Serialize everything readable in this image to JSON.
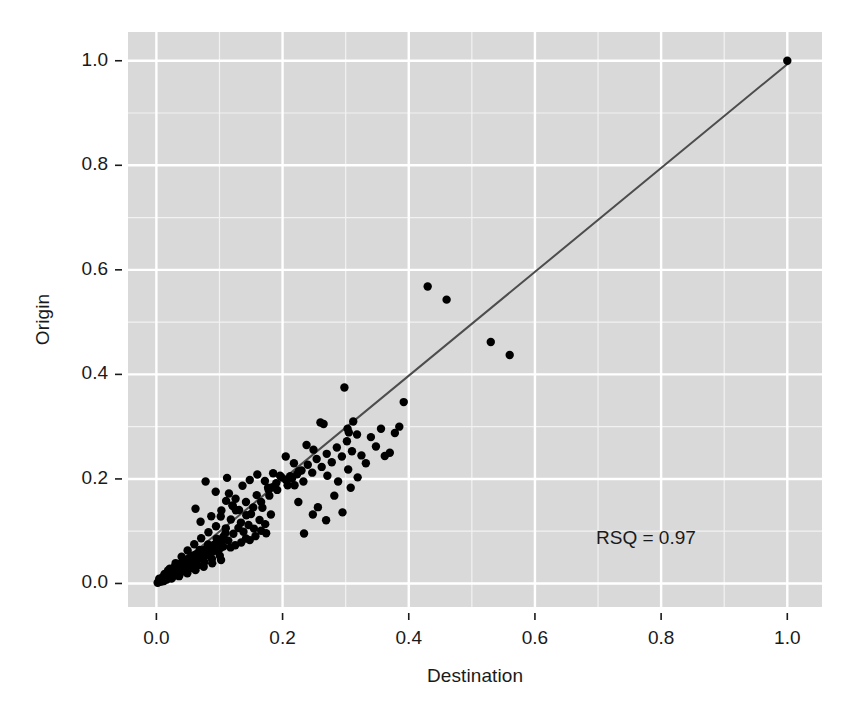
{
  "chart_data": {
    "type": "scatter",
    "title": "",
    "xlabel": "Destination",
    "ylabel": "Origin",
    "xlim": [
      -0.045,
      1.055
    ],
    "ylim": [
      -0.045,
      1.055
    ],
    "x_ticks": [
      0.0,
      0.2,
      0.4,
      0.6,
      0.8,
      1.0
    ],
    "y_ticks": [
      0.0,
      0.2,
      0.4,
      0.6,
      0.8,
      1.0
    ],
    "x_tick_labels": [
      "0.0",
      "0.2",
      "0.4",
      "0.6",
      "0.8",
      "1.0"
    ],
    "y_tick_labels": [
      "0.0",
      "0.2",
      "0.4",
      "0.6",
      "0.8",
      "1.0"
    ],
    "x_minor_ticks": [
      0.1,
      0.3,
      0.5,
      0.7,
      0.9
    ],
    "y_minor_ticks": [
      0.1,
      0.3,
      0.5,
      0.7,
      0.9
    ],
    "grid": true,
    "grid_major_color": "#ffffff",
    "grid_minor_color": "#f2f2f2",
    "panel_background": "#d9d9d9",
    "figure_background": "#ffffff",
    "point_color": "#000000",
    "point_radius": 4.2,
    "legend": null,
    "annotations": [
      {
        "text": "RSQ = 0.97",
        "x": 0.855,
        "y": 0.085
      }
    ],
    "fit_line": {
      "type": "linear",
      "color": "#4d4d4d",
      "width": 2.0,
      "x0": 0.0,
      "y0": 0.0,
      "x1": 1.0,
      "y1": 0.9935
    },
    "series": [
      {
        "name": "points",
        "points": [
          [
            0.002,
            0.0015
          ],
          [
            0.0035,
            0.0028
          ],
          [
            0.0042,
            0.005
          ],
          [
            0.0051,
            0.0036
          ],
          [
            0.006,
            0.0068
          ],
          [
            0.0068,
            0.0045
          ],
          [
            0.0075,
            0.0082
          ],
          [
            0.0083,
            0.0061
          ],
          [
            0.009,
            0.0104
          ],
          [
            0.0098,
            0.0076
          ],
          [
            0.0105,
            0.0122
          ],
          [
            0.0112,
            0.009
          ],
          [
            0.012,
            0.0138
          ],
          [
            0.0128,
            0.01
          ],
          [
            0.0136,
            0.0155
          ],
          [
            0.0144,
            0.0112
          ],
          [
            0.0152,
            0.017
          ],
          [
            0.016,
            0.0126
          ],
          [
            0.017,
            0.0188
          ],
          [
            0.0178,
            0.014
          ],
          [
            0.0186,
            0.0205
          ],
          [
            0.0195,
            0.0152
          ],
          [
            0.0203,
            0.0222
          ],
          [
            0.0212,
            0.0166
          ],
          [
            0.022,
            0.024
          ],
          [
            0.023,
            0.018
          ],
          [
            0.024,
            0.0258
          ],
          [
            0.025,
            0.0196
          ],
          [
            0.026,
            0.0275
          ],
          [
            0.027,
            0.021
          ],
          [
            0.028,
            0.0294
          ],
          [
            0.029,
            0.0225
          ],
          [
            0.03,
            0.0312
          ],
          [
            0.0312,
            0.024
          ],
          [
            0.0324,
            0.033
          ],
          [
            0.0336,
            0.0256
          ],
          [
            0.0348,
            0.035
          ],
          [
            0.036,
            0.0272
          ],
          [
            0.0372,
            0.0368
          ],
          [
            0.0384,
            0.0288
          ],
          [
            0.0396,
            0.0388
          ],
          [
            0.0408,
            0.0305
          ],
          [
            0.042,
            0.0408
          ],
          [
            0.0434,
            0.0322
          ],
          [
            0.0448,
            0.0428
          ],
          [
            0.0462,
            0.034
          ],
          [
            0.0476,
            0.0448
          ],
          [
            0.049,
            0.0358
          ],
          [
            0.0504,
            0.0468
          ],
          [
            0.0518,
            0.0376
          ],
          [
            0.0532,
            0.049
          ],
          [
            0.0546,
            0.0396
          ],
          [
            0.056,
            0.051
          ],
          [
            0.0576,
            0.0415
          ],
          [
            0.0592,
            0.0532
          ],
          [
            0.0608,
            0.0435
          ],
          [
            0.0624,
            0.0554
          ],
          [
            0.064,
            0.0455
          ],
          [
            0.0656,
            0.0576
          ],
          [
            0.0672,
            0.0476
          ],
          [
            0.0688,
            0.0598
          ],
          [
            0.0705,
            0.0496
          ],
          [
            0.0722,
            0.062
          ],
          [
            0.074,
            0.0518
          ],
          [
            0.0758,
            0.0642
          ],
          [
            0.0776,
            0.054
          ],
          [
            0.0794,
            0.0665
          ],
          [
            0.0812,
            0.0562
          ],
          [
            0.083,
            0.0688
          ],
          [
            0.085,
            0.0585
          ],
          [
            0.087,
            0.0712
          ],
          [
            0.089,
            0.0608
          ],
          [
            0.091,
            0.0736
          ],
          [
            0.093,
            0.0632
          ],
          [
            0.095,
            0.076
          ],
          [
            0.0972,
            0.0656
          ],
          [
            0.0994,
            0.0784
          ],
          [
            0.1016,
            0.068
          ],
          [
            0.1038,
            0.081
          ],
          [
            0.106,
            0.0705
          ],
          [
            0.0045,
            0.009
          ],
          [
            0.008,
            0.0035
          ],
          [
            0.013,
            0.018
          ],
          [
            0.0165,
            0.0075
          ],
          [
            0.0215,
            0.0285
          ],
          [
            0.0255,
            0.012
          ],
          [
            0.0305,
            0.039
          ],
          [
            0.0345,
            0.0175
          ],
          [
            0.04,
            0.051
          ],
          [
            0.044,
            0.023
          ],
          [
            0.0495,
            0.063
          ],
          [
            0.054,
            0.029
          ],
          [
            0.06,
            0.075
          ],
          [
            0.065,
            0.035
          ],
          [
            0.071,
            0.0865
          ],
          [
            0.076,
            0.041
          ],
          [
            0.0825,
            0.098
          ],
          [
            0.088,
            0.047
          ],
          [
            0.0945,
            0.1095
          ],
          [
            0.1005,
            0.053
          ],
          [
            0.012,
            0.0045
          ],
          [
            0.0185,
            0.025
          ],
          [
            0.024,
            0.0095
          ],
          [
            0.0295,
            0.033
          ],
          [
            0.036,
            0.014
          ],
          [
            0.0425,
            0.043
          ],
          [
            0.049,
            0.0195
          ],
          [
            0.0555,
            0.053
          ],
          [
            0.062,
            0.0255
          ],
          [
            0.0685,
            0.064
          ],
          [
            0.075,
            0.032
          ],
          [
            0.082,
            0.0745
          ],
          [
            0.0885,
            0.0385
          ],
          [
            0.0955,
            0.0855
          ],
          [
            0.1025,
            0.045
          ],
          [
            0.1095,
            0.0965
          ],
          [
            0.102,
            0.128
          ],
          [
            0.106,
            0.0895
          ],
          [
            0.11,
            0.1055
          ],
          [
            0.114,
            0.082
          ],
          [
            0.118,
            0.1225
          ],
          [
            0.122,
            0.095
          ],
          [
            0.126,
            0.14
          ],
          [
            0.13,
            0.106
          ],
          [
            0.134,
            0.1165
          ],
          [
            0.138,
            0.099
          ],
          [
            0.142,
            0.156
          ],
          [
            0.146,
            0.112
          ],
          [
            0.15,
            0.133
          ],
          [
            0.1545,
            0.105
          ],
          [
            0.159,
            0.169
          ],
          [
            0.1635,
            0.1215
          ],
          [
            0.168,
            0.145
          ],
          [
            0.1725,
            0.1135
          ],
          [
            0.177,
            0.183
          ],
          [
            0.1815,
            0.132
          ],
          [
            0.1105,
            0.158
          ],
          [
            0.115,
            0.172
          ],
          [
            0.1205,
            0.1495
          ],
          [
            0.1255,
            0.162
          ],
          [
            0.131,
            0.1405
          ],
          [
            0.1365,
            0.187
          ],
          [
            0.1425,
            0.1305
          ],
          [
            0.148,
            0.198
          ],
          [
            0.1535,
            0.1455
          ],
          [
            0.16,
            0.2085
          ],
          [
            0.166,
            0.156
          ],
          [
            0.172,
            0.196
          ],
          [
            0.179,
            0.168
          ],
          [
            0.185,
            0.211
          ],
          [
            0.1915,
            0.179
          ],
          [
            0.198,
            0.2035
          ],
          [
            0.062,
            0.143
          ],
          [
            0.07,
            0.118
          ],
          [
            0.078,
            0.195
          ],
          [
            0.087,
            0.1285
          ],
          [
            0.094,
            0.1755
          ],
          [
            0.103,
            0.1395
          ],
          [
            0.112,
            0.202
          ],
          [
            0.121,
            0.148
          ],
          [
            0.148,
            0.083
          ],
          [
            0.157,
            0.0905
          ],
          [
            0.166,
            0.101
          ],
          [
            0.174,
            0.096
          ],
          [
            0.1345,
            0.0785
          ],
          [
            0.142,
            0.086
          ],
          [
            0.125,
            0.073
          ],
          [
            0.1175,
            0.069
          ],
          [
            0.205,
            0.1985
          ],
          [
            0.212,
            0.205
          ],
          [
            0.219,
            0.188
          ],
          [
            0.226,
            0.215
          ],
          [
            0.233,
            0.195
          ],
          [
            0.24,
            0.227
          ],
          [
            0.247,
            0.212
          ],
          [
            0.254,
            0.238
          ],
          [
            0.262,
            0.223
          ],
          [
            0.27,
            0.248
          ],
          [
            0.278,
            0.232
          ],
          [
            0.286,
            0.26
          ],
          [
            0.294,
            0.243
          ],
          [
            0.302,
            0.272
          ],
          [
            0.31,
            0.253
          ],
          [
            0.318,
            0.285
          ],
          [
            0.234,
            0.0955
          ],
          [
            0.256,
            0.146
          ],
          [
            0.269,
            0.121
          ],
          [
            0.282,
            0.168
          ],
          [
            0.295,
            0.136
          ],
          [
            0.308,
            0.183
          ],
          [
            0.225,
            0.156
          ],
          [
            0.248,
            0.132
          ],
          [
            0.271,
            0.206
          ],
          [
            0.288,
            0.195
          ],
          [
            0.304,
            0.218
          ],
          [
            0.319,
            0.203
          ],
          [
            0.205,
            0.243
          ],
          [
            0.218,
            0.23
          ],
          [
            0.238,
            0.265
          ],
          [
            0.249,
            0.256
          ],
          [
            0.298,
            0.375
          ],
          [
            0.303,
            0.296
          ],
          [
            0.305,
            0.289
          ],
          [
            0.312,
            0.31
          ],
          [
            0.26,
            0.308
          ],
          [
            0.265,
            0.305
          ],
          [
            0.325,
            0.245
          ],
          [
            0.332,
            0.23
          ],
          [
            0.34,
            0.28
          ],
          [
            0.348,
            0.262
          ],
          [
            0.356,
            0.296
          ],
          [
            0.362,
            0.244
          ],
          [
            0.37,
            0.25
          ],
          [
            0.378,
            0.288
          ],
          [
            0.385,
            0.3
          ],
          [
            0.392,
            0.347
          ],
          [
            0.43,
            0.568
          ],
          [
            0.46,
            0.543
          ],
          [
            0.53,
            0.462
          ],
          [
            0.56,
            0.437
          ],
          [
            0.208,
            0.188
          ],
          [
            0.215,
            0.201
          ],
          [
            0.223,
            0.209
          ],
          [
            0.23,
            0.216
          ],
          [
            0.196,
            0.206
          ],
          [
            0.19,
            0.192
          ],
          [
            0.184,
            0.184
          ],
          [
            0.178,
            0.179
          ],
          [
            1.0,
            1.0
          ]
        ]
      }
    ]
  },
  "plot": {
    "panel": {
      "left": 128,
      "top": 32,
      "right": 822,
      "bottom": 607
    },
    "y_axis_title": "Origin",
    "x_axis_title": "Destination",
    "rsq_label": "RSQ = 0.97"
  }
}
